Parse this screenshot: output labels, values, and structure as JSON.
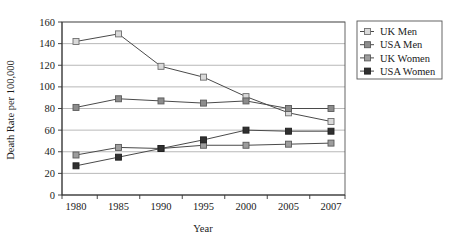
{
  "chart_data": {
    "type": "line",
    "title": "",
    "xlabel": "Year",
    "ylabel": "Death Rate per 100,000",
    "categories": [
      "1980",
      "1985",
      "1990",
      "1995",
      "2000",
      "2005",
      "2007"
    ],
    "ylim": [
      0,
      160
    ],
    "ytick_step": 20,
    "yticks": [
      "0",
      "20",
      "40",
      "60",
      "80",
      "100",
      "120",
      "140",
      "160"
    ],
    "grid": true,
    "legend_position": "right",
    "series": [
      {
        "name": "UK Men",
        "values": [
          142,
          149,
          119,
          109,
          91,
          76,
          68
        ],
        "marker": "square-hollow",
        "marker_fill": "#d9d9d9",
        "marker_stroke": "#6e6e6e",
        "line_color": "#4a4a4a"
      },
      {
        "name": "USA Men",
        "values": [
          81,
          89,
          87,
          85,
          87,
          80,
          80
        ],
        "marker": "square-filled",
        "marker_fill": "#8c8c8c",
        "marker_stroke": "#5a5a5a",
        "line_color": "#4a4a4a"
      },
      {
        "name": "UK Women",
        "values": [
          37,
          44,
          43,
          46,
          46,
          47,
          48
        ],
        "marker": "square-filled",
        "marker_fill": "#9d9d9d",
        "marker_stroke": "#5a5a5a",
        "line_color": "#4a4a4a"
      },
      {
        "name": "USA Women",
        "values": [
          27,
          35,
          43,
          51,
          60,
          59,
          59
        ],
        "marker": "square-filled",
        "marker_fill": "#303030",
        "marker_stroke": "#202020",
        "line_color": "#4a4a4a"
      }
    ]
  },
  "colors": {
    "background": "#ffffff",
    "grid": "#9a9a9a",
    "frame": "#555555",
    "text": "#1a1a1a"
  }
}
